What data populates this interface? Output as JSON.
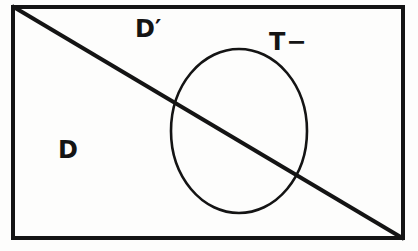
{
  "figure": {
    "kind": "set-diagram",
    "caption": "",
    "background_color": "#fdfdfc",
    "ink_color": "#141414"
  },
  "labels": {
    "d_prime": "D′",
    "t_minus": "T−",
    "d": "D"
  },
  "shapes": {
    "frame": {
      "name": "universe-rectangle",
      "x": 11,
      "y": 5,
      "width": 394,
      "height": 235,
      "stroke_width": 4,
      "stroke": "#141414",
      "fill": "none"
    },
    "diagonal": {
      "name": "decision-boundary-line",
      "x1": 11,
      "y1": 5,
      "x2": 405,
      "y2": 240,
      "stroke_width": 4,
      "stroke": "#141414"
    },
    "ellipse": {
      "name": "test-positive-ellipse",
      "cx": 239,
      "cy": 131,
      "rx": 68,
      "ry": 82,
      "stroke_width": 2.6,
      "stroke": "#141414",
      "fill": "none"
    }
  }
}
